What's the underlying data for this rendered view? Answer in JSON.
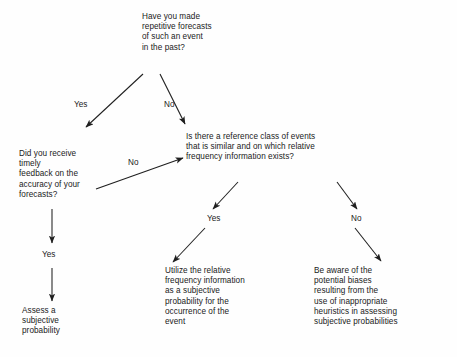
{
  "diagram": {
    "type": "decision-tree-flowchart",
    "nodes": {
      "root_question": "Have you made\nrepetitive forecasts\nof such an event\nin the past?",
      "feedback_question": "Did you receive\ntimely\nfeedback on the\naccuracy of your\nforecasts?",
      "reference_class_question": "Is there a reference class of events\nthat is similar and on which relative\nfrequency information exists?",
      "outcome_assess": "Assess a\nsubjective\nprobability",
      "outcome_utilize": "Utilize the relative\nfrequency information\nas a subjective\nprobability for the\noccurrence of the\nevent",
      "outcome_bias": "Be aware of the\npotential biases\nresulting from the\nuse of inappropriate\nheuristics in assessing\nsubjective probabilities"
    },
    "edge_labels": {
      "root_yes": "Yes",
      "root_no": "No",
      "feedback_no": "No",
      "feedback_yes": "Yes",
      "reference_yes": "Yes",
      "reference_no": "No"
    },
    "colors": {
      "ink": "#1f1f1f",
      "background": "#fefefe"
    }
  }
}
